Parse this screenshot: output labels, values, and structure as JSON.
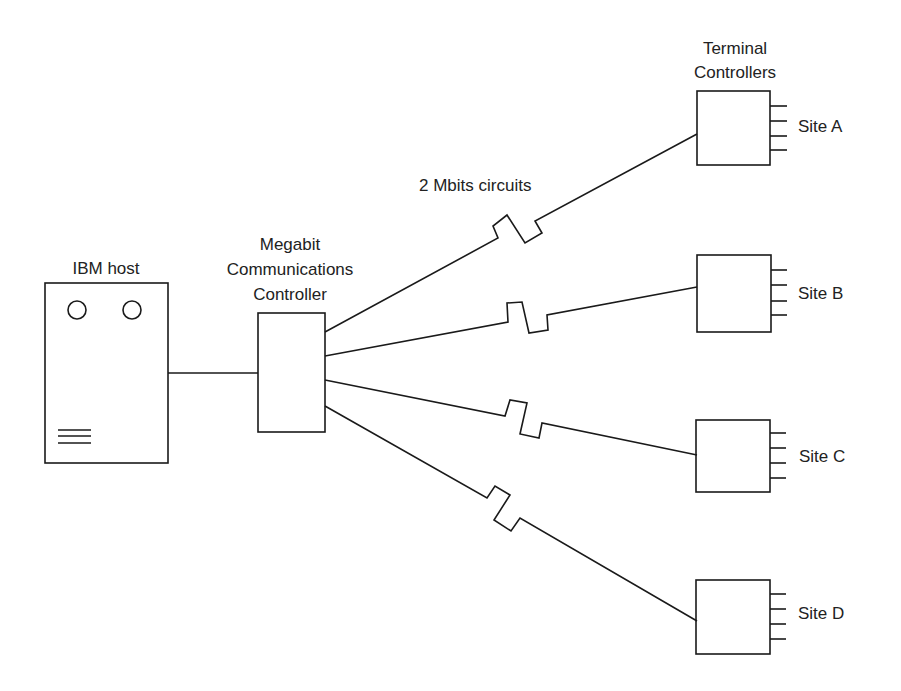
{
  "diagram": {
    "host": {
      "label": "IBM host"
    },
    "controller": {
      "label_lines": [
        "Megabit",
        "Communications",
        "Controller"
      ]
    },
    "circuit_label": "2 Mbits circuits",
    "terminal_header": {
      "label_lines": [
        "Terminal",
        "Controllers"
      ]
    },
    "sites": [
      {
        "id": "A",
        "label": "Site A"
      },
      {
        "id": "B",
        "label": "Site B"
      },
      {
        "id": "C",
        "label": "Site C"
      },
      {
        "id": "D",
        "label": "Site D"
      }
    ],
    "colors": {
      "line": "#1a1a1a",
      "background": "#ffffff"
    }
  }
}
